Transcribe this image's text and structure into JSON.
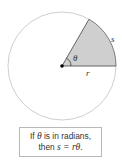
{
  "diagram": {
    "type": "circle-sector",
    "labels": {
      "angle": "θ",
      "radius": "r",
      "arc": "s"
    },
    "colors": {
      "sector_fill": "#cfcfcf",
      "circle_stroke": "#c8c8c8",
      "lines": "#555555",
      "dot": "#000000"
    }
  },
  "caption": {
    "line1_pre": "If ",
    "line1_var": "θ",
    "line1_post": " is in radians,",
    "line2_pre": "then ",
    "line2_formula": "s = rθ",
    "line2_post": "."
  }
}
